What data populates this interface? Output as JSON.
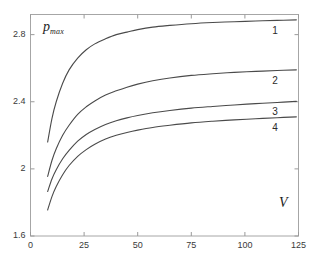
{
  "chart_data": {
    "type": "line",
    "title": "",
    "subtitle": "",
    "xlabel": "V",
    "ylabel": "p_max",
    "ylabel_base": "p",
    "ylabel_sub": "max",
    "xlim": [
      0,
      125
    ],
    "ylim": [
      1.6,
      2.92
    ],
    "xticks": [
      0,
      25,
      50,
      75,
      100,
      125
    ],
    "yticks": [
      1.6,
      2,
      2.4,
      2.8
    ],
    "xtick_labels": [
      "0",
      "25",
      "50",
      "75",
      "100",
      "125"
    ],
    "ytick_labels": [
      "1.6",
      "2",
      "2.4",
      "2.8"
    ],
    "grid": false,
    "legend": "inline-curve-numbers",
    "legend_position": "right-end-of-each-curve",
    "line_color": "#4a4a4a",
    "axis_color": "#9a9a9a",
    "background_color": "#ffffff",
    "series": [
      {
        "name": "1",
        "label": "1",
        "label_value": "1",
        "x": [
          8,
          10,
          12,
          15,
          18,
          22,
          26,
          30,
          35,
          40,
          45,
          50,
          57,
          65,
          75,
          85,
          95,
          105,
          115,
          124
        ],
        "y": [
          2.16,
          2.3,
          2.4,
          2.51,
          2.59,
          2.66,
          2.71,
          2.745,
          2.775,
          2.8,
          2.815,
          2.83,
          2.845,
          2.855,
          2.865,
          2.872,
          2.877,
          2.881,
          2.885,
          2.888
        ]
      },
      {
        "name": "2",
        "label": "2",
        "label_value": "2",
        "x": [
          8,
          10,
          12,
          15,
          18,
          22,
          26,
          30,
          35,
          40,
          45,
          50,
          57,
          65,
          75,
          85,
          95,
          105,
          115,
          124
        ],
        "y": [
          1.955,
          2.05,
          2.12,
          2.2,
          2.26,
          2.325,
          2.37,
          2.405,
          2.44,
          2.465,
          2.487,
          2.505,
          2.525,
          2.542,
          2.557,
          2.567,
          2.575,
          2.581,
          2.586,
          2.59
        ]
      },
      {
        "name": "3",
        "label": "3",
        "label_value": "3",
        "x": [
          8,
          10,
          12,
          15,
          18,
          22,
          26,
          30,
          35,
          40,
          45,
          50,
          57,
          65,
          75,
          85,
          95,
          105,
          115,
          124
        ],
        "y": [
          1.865,
          1.94,
          1.995,
          2.06,
          2.11,
          2.165,
          2.205,
          2.235,
          2.265,
          2.287,
          2.304,
          2.318,
          2.334,
          2.348,
          2.362,
          2.372,
          2.381,
          2.389,
          2.396,
          2.402
        ]
      },
      {
        "name": "4",
        "label": "4",
        "label_value": "4",
        "x": [
          8,
          10,
          12,
          15,
          18,
          22,
          26,
          30,
          35,
          40,
          45,
          50,
          57,
          65,
          75,
          85,
          95,
          105,
          115,
          124
        ],
        "y": [
          1.755,
          1.835,
          1.895,
          1.965,
          2.02,
          2.075,
          2.115,
          2.147,
          2.178,
          2.2,
          2.217,
          2.231,
          2.247,
          2.26,
          2.274,
          2.284,
          2.292,
          2.299,
          2.305,
          2.31
        ]
      }
    ]
  },
  "axes": {
    "x_tick_labels": [
      "0",
      "25",
      "50",
      "75",
      "100",
      "125"
    ],
    "y_tick_labels": [
      "1.6",
      "2",
      "2.4",
      "2.8"
    ],
    "x_axis_title": "V",
    "y_axis_title_base": "p",
    "y_axis_title_sub": "max"
  },
  "curve_labels": [
    "1",
    "2",
    "3",
    "4"
  ]
}
